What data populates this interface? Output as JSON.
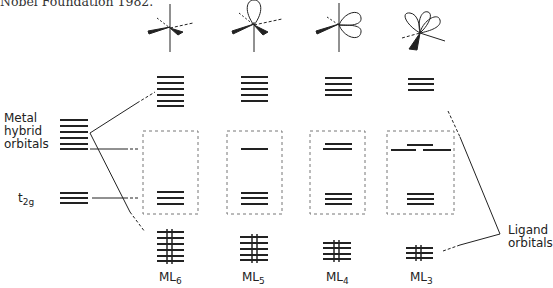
{
  "caption": "Nobel Foundation 1982.",
  "labels": {
    "metal_hybrid": [
      "Metal",
      "hybrid",
      "orbitals"
    ],
    "t2g_main": "t",
    "t2g_sub": "2g",
    "ligand": [
      "Ligand",
      "orbitals"
    ]
  },
  "complexes": [
    {
      "base": "ML",
      "sub": "6",
      "upper_levels": 6,
      "frontier_levels": 0,
      "t2g_levels": 3,
      "filled_levels": 6
    },
    {
      "base": "ML",
      "sub": "5",
      "upper_levels": 5,
      "frontier_levels": 1,
      "t2g_levels": 3,
      "filled_levels": 5
    },
    {
      "base": "ML",
      "sub": "4",
      "upper_levels": 4,
      "frontier_levels": 2,
      "t2g_levels": 3,
      "filled_levels": 4
    },
    {
      "base": "ML",
      "sub": "3",
      "upper_levels": 3,
      "frontier_levels": 3,
      "t2g_levels": 3,
      "filled_levels": 3
    }
  ],
  "colors": {
    "ink": "#222222",
    "dash": "#777777"
  }
}
